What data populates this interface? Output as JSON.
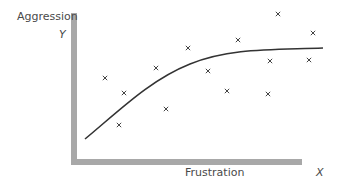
{
  "labels": {
    "y_title": "Aggression",
    "y_symbol": "Y",
    "x_title": "Frustration",
    "x_symbol": "X"
  },
  "colors": {
    "axis": "#a8a8a8",
    "curve": "#333333",
    "points": "#444444",
    "text": "#4a4a4a"
  },
  "chart_data": {
    "type": "scatter",
    "title": "",
    "xlabel": "Frustration (X)",
    "ylabel": "Aggression (Y)",
    "grid": false,
    "points_px": [
      [
        105,
        78
      ],
      [
        124,
        93
      ],
      [
        119,
        125
      ],
      [
        156,
        68
      ],
      [
        188,
        48
      ],
      [
        166,
        109
      ],
      [
        208,
        71
      ],
      [
        227,
        91
      ],
      [
        238,
        40
      ],
      [
        268,
        94
      ],
      [
        270,
        61
      ],
      [
        278,
        14
      ],
      [
        309,
        60
      ],
      [
        313,
        33
      ]
    ],
    "fit_curve": "concave increasing, saturating (logarithmic-like) trend from lower-left to upper-right"
  }
}
